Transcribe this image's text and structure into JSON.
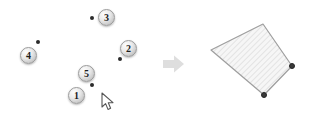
{
  "canvas": {
    "width": 336,
    "height": 129,
    "background_color": "#ffffff",
    "grid_color": "#ececec",
    "grid_spacing_px": 15
  },
  "left_panel": {
    "name": "point-selection-canvas",
    "grid": {
      "x": 8,
      "y": 5,
      "width": 150,
      "height": 115
    },
    "badges": [
      {
        "label": "4",
        "x": 28,
        "y": 52
      },
      {
        "label": "3",
        "x": 106,
        "y": 14
      },
      {
        "label": "2",
        "x": 128,
        "y": 45
      },
      {
        "label": "5",
        "x": 86,
        "y": 70
      },
      {
        "label": "1",
        "x": 76,
        "y": 92
      }
    ],
    "dots": [
      {
        "name": "point-a",
        "x": 44,
        "y": 45
      },
      {
        "name": "point-b",
        "x": 98,
        "y": 21
      },
      {
        "name": "point-c",
        "x": 126,
        "y": 62
      },
      {
        "name": "point-d",
        "x": 98,
        "y": 88
      }
    ],
    "cursor": {
      "name": "mouse-pointer",
      "x": 101,
      "y": 92
    }
  },
  "flow": {
    "arrow_label": "transforms-into",
    "arrow_color": "#dcdcdc"
  },
  "right_panel": {
    "name": "polygon-result-canvas",
    "grid": {
      "x": 186,
      "y": 5,
      "width": 143,
      "height": 115
    },
    "polygon": {
      "name": "quadrilateral",
      "points": "77,19 25,45 78,90 106,61",
      "fill_color": "#f4f4f4",
      "stroke_color": "#9e9e9e",
      "hatch_color": "#d8d8d8"
    },
    "vertices": [
      {
        "name": "vertex-right",
        "x": 289,
        "y": 63
      },
      {
        "name": "vertex-bottom",
        "x": 261,
        "y": 92
      }
    ]
  }
}
